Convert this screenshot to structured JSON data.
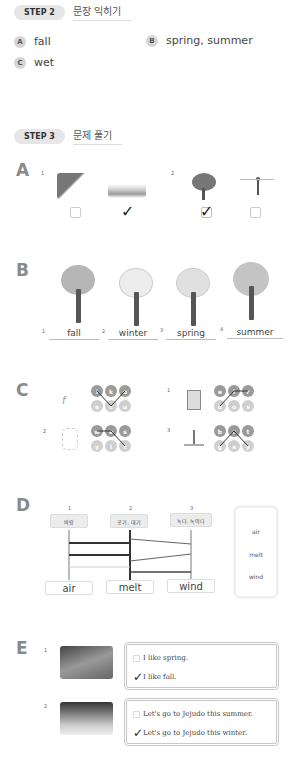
{
  "step2": {
    "pill": "STEP 2",
    "title": "문장 익히기",
    "answers": [
      {
        "bullet": "A",
        "text": "fall"
      },
      {
        "bullet": "B",
        "text": "spring, summer"
      },
      {
        "bullet": "C",
        "text": "wet"
      }
    ]
  },
  "step3": {
    "pill": "STEP 3",
    "title": "문제 풀기"
  },
  "sectionA": {
    "letter": "A",
    "groups": [
      {
        "num": "1",
        "options": [
          {
            "picture": "fall-leaves-scene",
            "checked": false
          },
          {
            "picture": "winter-field-scene",
            "checked": true
          }
        ]
      },
      {
        "num": "2",
        "options": [
          {
            "picture": "green-tree-scene",
            "checked": true
          },
          {
            "picture": "windy-person-scene",
            "checked": false
          }
        ]
      }
    ]
  },
  "sectionB": {
    "letter": "B",
    "trees": [
      {
        "num": "1",
        "label": "fall",
        "crown_color": "#b5b5b5"
      },
      {
        "num": "2",
        "label": "winter",
        "crown_color": "#ececec"
      },
      {
        "num": "3",
        "label": "spring",
        "crown_color": "#e2e2e2"
      },
      {
        "num": "4",
        "label": "summer",
        "crown_color": "#c4c4c4"
      }
    ]
  },
  "sectionC": {
    "letter": "C",
    "puzzles": [
      {
        "num": "",
        "top": [
          "i",
          "k",
          "o"
        ],
        "bottom": [
          "e",
          "c",
          "u"
        ]
      },
      {
        "num": "1",
        "top": [
          "e",
          "l",
          "r"
        ],
        "bottom": [
          "u",
          "o",
          "s"
        ]
      },
      {
        "num": "2",
        "top": [
          "w",
          "e",
          "s"
        ],
        "bottom": [
          "y",
          "l",
          "t"
        ]
      },
      {
        "num": "3",
        "top": [
          "b",
          "r",
          "t"
        ],
        "bottom": [
          "g",
          "a",
          "y"
        ]
      }
    ]
  },
  "sectionD": {
    "letter": "D",
    "columns": [
      {
        "num": "1",
        "korean": "바람",
        "english": "air"
      },
      {
        "num": "2",
        "korean": "공기, 대기",
        "english": "melt"
      },
      {
        "num": "3",
        "korean": "녹다, 녹이다",
        "english": "wind"
      }
    ],
    "word_bank": [
      "air",
      "melt",
      "wind"
    ]
  },
  "sectionE": {
    "letter": "E",
    "items": [
      {
        "num": "1",
        "picture": "child-in-fall-leaves",
        "choices": [
          {
            "text": "I like spring.",
            "checked": false
          },
          {
            "text": "I like fall.",
            "checked": true
          }
        ]
      },
      {
        "num": "2",
        "picture": "snowy-mountain",
        "choices": [
          {
            "text": "Let's go to Jejudo this summer.",
            "checked": false
          },
          {
            "text": "Let's go to Jejudo this winter.",
            "checked": true
          }
        ]
      }
    ]
  },
  "check_glyph": "✓"
}
